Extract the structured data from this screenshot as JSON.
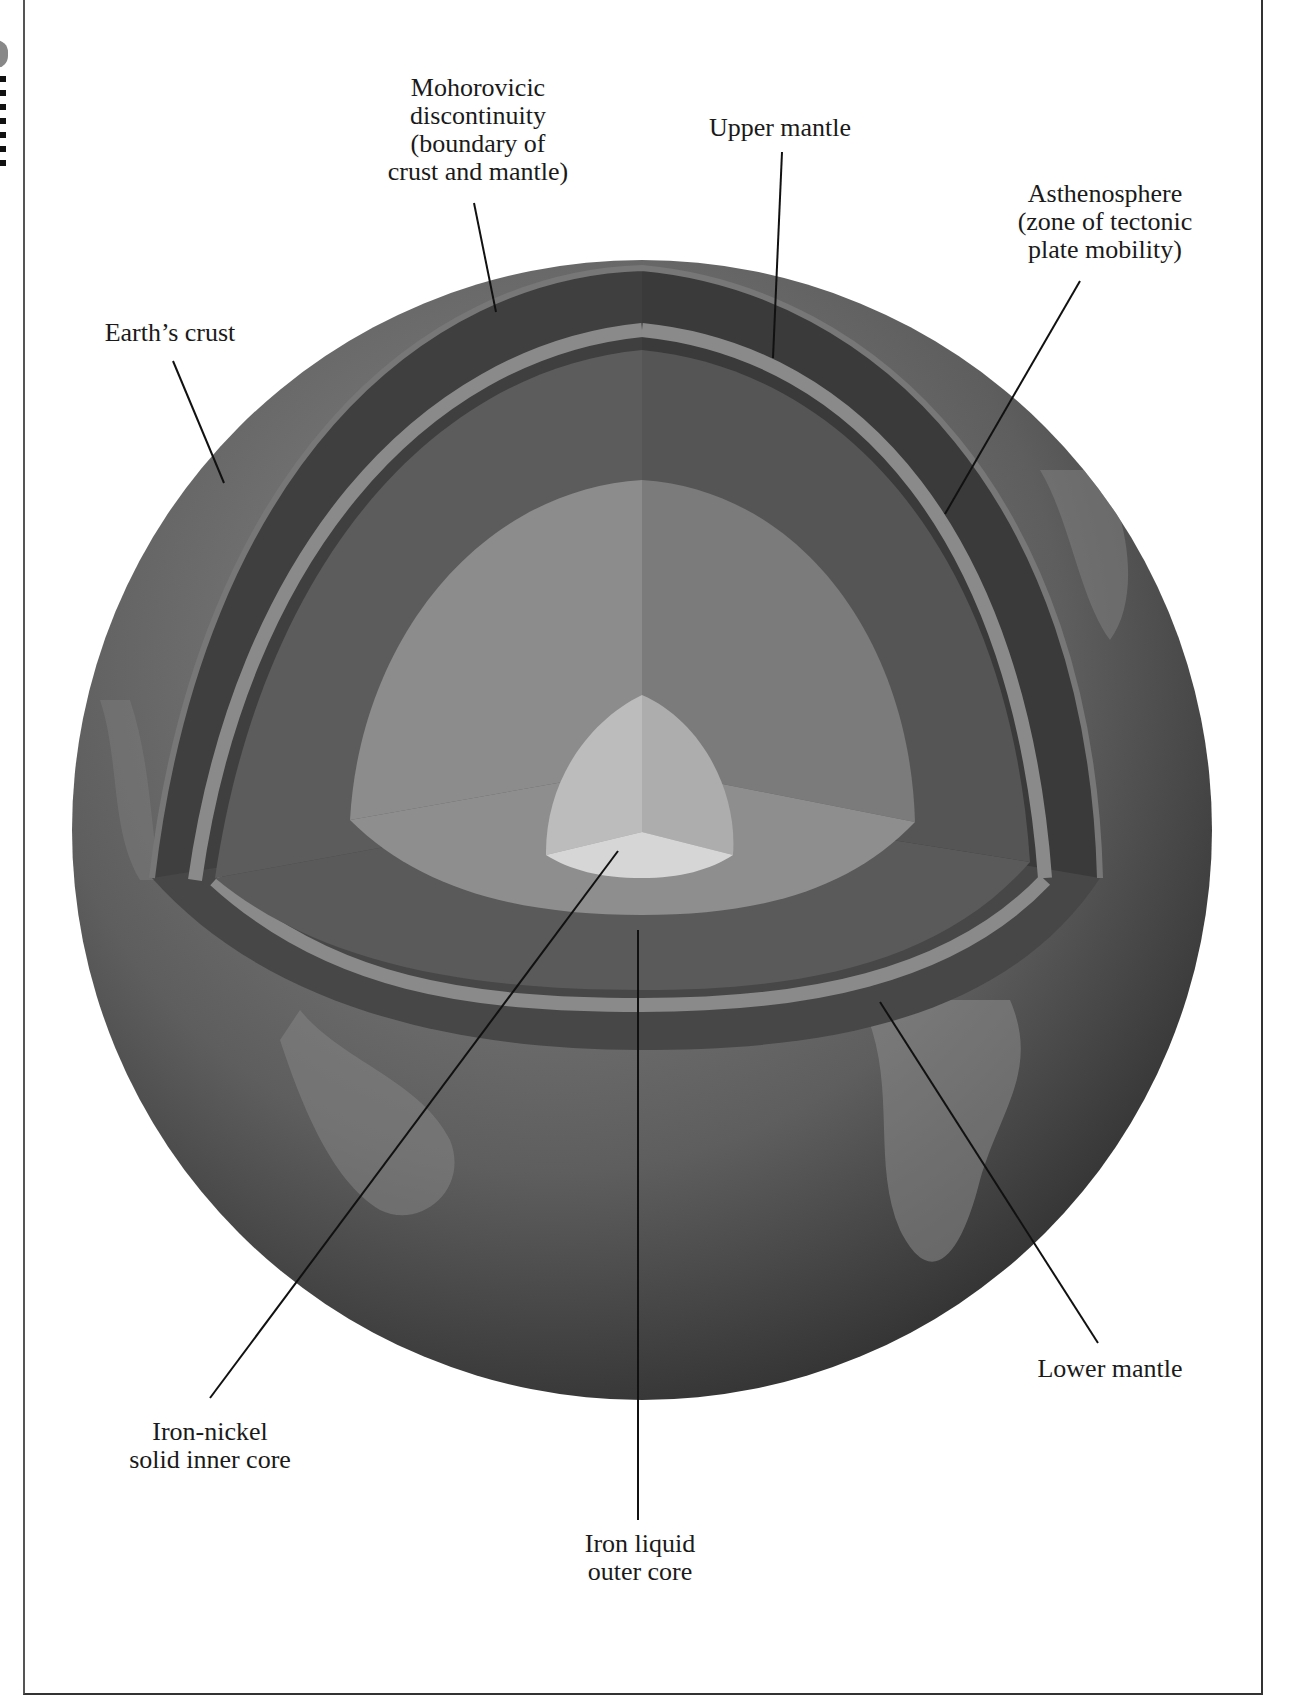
{
  "diagram": {
    "colors": {
      "crust_surface": "#6e6e6e",
      "crust_dark": "#3c3c3c",
      "upper_mantle": "#4a4a4a",
      "asthenosphere_band": "#8a8a8a",
      "lower_mantle": "#666666",
      "outer_core": "#8c8c8c",
      "inner_core": "#bdbdbd",
      "inner_core_top": "#d6d6d6",
      "leader_line": "#111111"
    },
    "labels": {
      "moho": [
        "Mohorovicic",
        "discontinuity",
        "(boundary of",
        "crust and mantle)"
      ],
      "upper_mantle": [
        "Upper mantle"
      ],
      "asthenosphere": [
        "Asthenosphere",
        "(zone of tectonic",
        "plate mobility)"
      ],
      "crust": [
        "Earth’s crust"
      ],
      "lower_mantle": [
        "Lower mantle"
      ],
      "inner_core": [
        "Iron-nickel",
        "solid inner core"
      ],
      "outer_core": [
        "Iron liquid",
        "outer core"
      ]
    }
  }
}
